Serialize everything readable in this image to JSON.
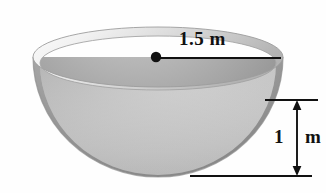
{
  "figure": {
    "name": "hemispherical-bowl-diagram",
    "shape": "hemisphere",
    "background_color": "#fefefe"
  },
  "labels": {
    "radius": "1.5 m",
    "height": "1 m",
    "height_number": "1",
    "height_unit": "m"
  },
  "colors": {
    "line": "#111111",
    "rim_light": "#f2f2f2",
    "rim_mid": "#d8d8d8",
    "inner_light": "#d0d0d0",
    "inner_mid": "#bdbdbd",
    "outer_light": "#bcbcbc",
    "outer_mid": "#9a9a9a",
    "outer_dark": "#7e7e7e"
  },
  "geometry": {
    "rim_center_x": 158,
    "rim_center_y": 57,
    "rim_radius_x": 125,
    "rim_radius_y": 30,
    "bowl_bottom_y": 177,
    "radius_line_from_x": 156,
    "radius_line_to_x": 281,
    "radius_line_y": 58,
    "center_dot_radius": 5,
    "height_arrow_x": 297,
    "height_top_y": 100,
    "height_bottom_y": 176,
    "guide_top_from_x": 265,
    "guide_top_to_x": 318,
    "guide_bottom_from_x": 190,
    "guide_bottom_to_x": 312
  }
}
